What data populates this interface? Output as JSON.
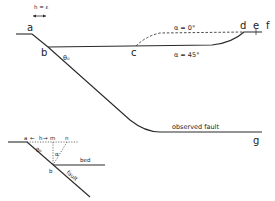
{
  "main_diagram": {
    "scale_label": "h = ε",
    "points": {
      "a": "a",
      "b": "b",
      "c": "c",
      "d": "d",
      "e": "e",
      "f": "f",
      "g": "g"
    },
    "angle_label": "θ₀",
    "curve_labels": {
      "alpha0": "α = 0°",
      "alpha45": "α = 45°"
    },
    "fault_label": "observed fault"
  },
  "inset_diagram": {
    "points": {
      "a": "a",
      "m": "m",
      "n": "n",
      "b": "b"
    },
    "h_label": "h",
    "theta_label": "θ₀",
    "alpha_label": "α",
    "bed_label": "bed",
    "fault_label": "fault"
  },
  "colors": {
    "line": "#2a2a2a",
    "background": "#ffffff"
  }
}
